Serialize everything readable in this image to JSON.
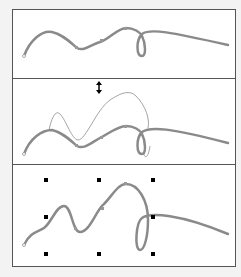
{
  "colors": {
    "curve": "#8a8a8a",
    "thin_curve": "#9a9a9a",
    "frame": "#555555",
    "handle": "#000000",
    "background": "#f3f3f3",
    "panel": "#ffffff"
  },
  "panels": [
    {
      "name": "original-curve",
      "icon": null
    },
    {
      "name": "curve-with-move-cursor",
      "icon": "vertical-double-arrow-icon"
    },
    {
      "name": "curve-with-selection-handles",
      "icon": "selection-handles"
    }
  ]
}
